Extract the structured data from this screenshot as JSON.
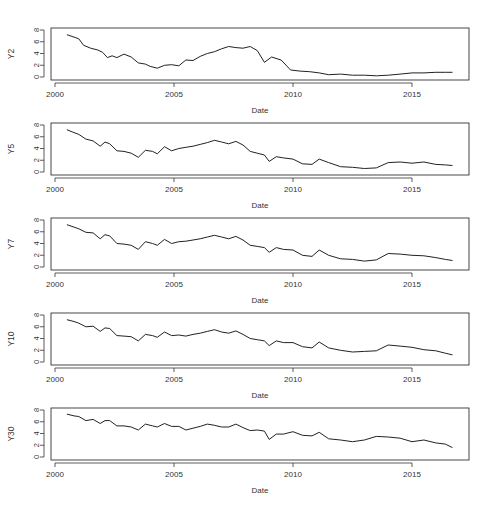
{
  "chart_data": [
    {
      "type": "line",
      "title": "",
      "xlabel": "Date",
      "ylabel": "Y2",
      "xlim": [
        2000,
        2017.3
      ],
      "ylim": [
        0,
        8
      ],
      "xticks": [
        2000,
        2005,
        2010,
        2015
      ],
      "yticks": [
        0,
        2,
        4,
        6,
        8
      ],
      "grid": false,
      "legend": null,
      "x": [
        2000.5,
        2000.8,
        2001.0,
        2001.2,
        2001.5,
        2001.8,
        2002.0,
        2002.2,
        2002.4,
        2002.6,
        2002.9,
        2003.2,
        2003.5,
        2003.8,
        2004.0,
        2004.3,
        2004.6,
        2004.9,
        2005.2,
        2005.5,
        2005.8,
        2006.1,
        2006.4,
        2006.7,
        2007.0,
        2007.3,
        2007.6,
        2007.9,
        2008.2,
        2008.5,
        2008.8,
        2009.1,
        2009.5,
        2009.9,
        2010.3,
        2010.7,
        2011.1,
        2011.5,
        2012.0,
        2012.5,
        2013.0,
        2013.5,
        2014.0,
        2014.5,
        2015.0,
        2015.5,
        2016.0,
        2016.4,
        2016.7
      ],
      "values": [
        7.2,
        6.8,
        6.5,
        5.4,
        4.9,
        4.6,
        4.2,
        3.3,
        3.6,
        3.3,
        3.9,
        3.4,
        2.4,
        2.2,
        1.8,
        1.5,
        2.0,
        2.1,
        1.9,
        2.9,
        2.8,
        3.5,
        4.0,
        4.3,
        4.8,
        5.2,
        5.0,
        4.9,
        5.2,
        4.5,
        2.5,
        3.4,
        2.9,
        1.2,
        1.0,
        0.9,
        0.7,
        0.4,
        0.5,
        0.3,
        0.3,
        0.2,
        0.3,
        0.5,
        0.7,
        0.7,
        0.8,
        0.8,
        0.8
      ]
    },
    {
      "type": "line",
      "xlabel": "Date",
      "ylabel": "Y5",
      "xlim": [
        2000,
        2017.3
      ],
      "ylim": [
        0,
        8
      ],
      "xticks": [
        2000,
        2005,
        2010,
        2015
      ],
      "yticks": [
        0,
        2,
        4,
        6,
        8
      ],
      "x": [
        2000.5,
        2000.8,
        2001.0,
        2001.3,
        2001.6,
        2001.9,
        2002.1,
        2002.3,
        2002.6,
        2002.9,
        2003.2,
        2003.5,
        2003.8,
        2004.1,
        2004.3,
        2004.6,
        2004.9,
        2005.2,
        2005.5,
        2005.8,
        2006.1,
        2006.4,
        2006.7,
        2007.0,
        2007.3,
        2007.6,
        2007.9,
        2008.2,
        2008.5,
        2008.8,
        2009.0,
        2009.3,
        2009.6,
        2010.0,
        2010.4,
        2010.8,
        2011.1,
        2011.5,
        2012.0,
        2012.5,
        2013.0,
        2013.5,
        2014.0,
        2014.5,
        2015.0,
        2015.5,
        2016.0,
        2016.4,
        2016.7
      ],
      "values": [
        7.2,
        6.7,
        6.4,
        5.6,
        5.3,
        4.4,
        5.1,
        4.8,
        3.6,
        3.5,
        3.2,
        2.5,
        3.7,
        3.5,
        3.1,
        4.3,
        3.6,
        4.0,
        4.2,
        4.4,
        4.7,
        5.0,
        5.4,
        5.1,
        4.8,
        5.2,
        4.6,
        3.5,
        3.2,
        2.9,
        1.8,
        2.6,
        2.4,
        2.2,
        1.4,
        1.3,
        2.2,
        1.6,
        0.9,
        0.8,
        0.6,
        0.7,
        1.6,
        1.7,
        1.5,
        1.7,
        1.3,
        1.2,
        1.1
      ]
    },
    {
      "type": "line",
      "xlabel": "Date",
      "ylabel": "Y7",
      "xlim": [
        2000,
        2017.3
      ],
      "ylim": [
        0,
        8
      ],
      "xticks": [
        2000,
        2005,
        2010,
        2015
      ],
      "yticks": [
        0,
        2,
        4,
        6,
        8
      ],
      "x": [
        2000.5,
        2000.8,
        2001.0,
        2001.3,
        2001.6,
        2001.9,
        2002.1,
        2002.3,
        2002.6,
        2002.9,
        2003.2,
        2003.5,
        2003.8,
        2004.1,
        2004.3,
        2004.6,
        2004.9,
        2005.2,
        2005.5,
        2005.8,
        2006.1,
        2006.4,
        2006.7,
        2007.0,
        2007.3,
        2007.6,
        2007.9,
        2008.2,
        2008.5,
        2008.8,
        2009.0,
        2009.3,
        2009.6,
        2010.0,
        2010.4,
        2010.8,
        2011.1,
        2011.5,
        2012.0,
        2012.5,
        2013.0,
        2013.5,
        2014.0,
        2014.5,
        2015.0,
        2015.5,
        2016.0,
        2016.4,
        2016.7
      ],
      "values": [
        7.2,
        6.8,
        6.5,
        5.9,
        5.8,
        4.8,
        5.5,
        5.3,
        4.0,
        3.9,
        3.7,
        3.0,
        4.3,
        4.0,
        3.7,
        4.7,
        4.0,
        4.3,
        4.4,
        4.6,
        4.8,
        5.1,
        5.4,
        5.1,
        4.8,
        5.2,
        4.6,
        3.7,
        3.5,
        3.3,
        2.5,
        3.3,
        3.0,
        2.9,
        2.0,
        1.8,
        2.9,
        2.0,
        1.4,
        1.3,
        1.0,
        1.2,
        2.3,
        2.2,
        2.0,
        1.9,
        1.6,
        1.3,
        1.1
      ]
    },
    {
      "type": "line",
      "xlabel": "Date",
      "ylabel": "Y10",
      "xlim": [
        2000,
        2017.3
      ],
      "ylim": [
        0,
        8
      ],
      "xticks": [
        2000,
        2005,
        2010,
        2015
      ],
      "yticks": [
        0,
        2,
        4,
        6,
        8
      ],
      "x": [
        2000.5,
        2000.8,
        2001.0,
        2001.3,
        2001.6,
        2001.9,
        2002.1,
        2002.3,
        2002.6,
        2002.9,
        2003.2,
        2003.5,
        2003.8,
        2004.1,
        2004.3,
        2004.6,
        2004.9,
        2005.2,
        2005.5,
        2005.8,
        2006.1,
        2006.4,
        2006.7,
        2007.0,
        2007.3,
        2007.6,
        2007.9,
        2008.2,
        2008.5,
        2008.8,
        2009.0,
        2009.3,
        2009.6,
        2010.0,
        2010.4,
        2010.8,
        2011.1,
        2011.5,
        2012.0,
        2012.5,
        2013.0,
        2013.5,
        2014.0,
        2014.5,
        2015.0,
        2015.5,
        2016.0,
        2016.4,
        2016.7
      ],
      "values": [
        7.2,
        6.9,
        6.6,
        6.0,
        6.1,
        5.2,
        5.8,
        5.7,
        4.5,
        4.4,
        4.3,
        3.6,
        4.7,
        4.5,
        4.2,
        5.1,
        4.5,
        4.6,
        4.4,
        4.7,
        4.9,
        5.2,
        5.5,
        5.1,
        4.9,
        5.3,
        4.7,
        4.0,
        3.8,
        3.6,
        2.8,
        3.6,
        3.3,
        3.3,
        2.6,
        2.4,
        3.4,
        2.4,
        2.0,
        1.7,
        1.8,
        1.9,
        2.9,
        2.7,
        2.5,
        2.1,
        1.9,
        1.5,
        1.2
      ]
    },
    {
      "type": "line",
      "xlabel": "Date",
      "ylabel": "Y30",
      "xlim": [
        2000,
        2017.3
      ],
      "ylim": [
        0,
        8
      ],
      "xticks": [
        2000,
        2005,
        2010,
        2015
      ],
      "yticks": [
        0,
        2,
        4,
        6,
        8
      ],
      "x": [
        2000.5,
        2000.8,
        2001.0,
        2001.3,
        2001.6,
        2001.9,
        2002.1,
        2002.3,
        2002.6,
        2002.9,
        2003.2,
        2003.5,
        2003.8,
        2004.1,
        2004.3,
        2004.6,
        2004.9,
        2005.2,
        2005.5,
        2005.8,
        2006.1,
        2006.4,
        2006.7,
        2007.0,
        2007.3,
        2007.6,
        2007.9,
        2008.2,
        2008.5,
        2008.8,
        2009.0,
        2009.3,
        2009.6,
        2010.0,
        2010.4,
        2010.8,
        2011.1,
        2011.5,
        2012.0,
        2012.5,
        2013.0,
        2013.5,
        2014.0,
        2014.5,
        2015.0,
        2015.5,
        2016.0,
        2016.4,
        2016.7
      ],
      "values": [
        7.3,
        7.0,
        6.9,
        6.2,
        6.4,
        5.7,
        6.2,
        6.2,
        5.3,
        5.3,
        5.1,
        4.6,
        5.6,
        5.3,
        5.1,
        5.7,
        5.2,
        5.2,
        4.6,
        4.9,
        5.2,
        5.6,
        5.4,
        5.1,
        5.1,
        5.6,
        5.0,
        4.5,
        4.6,
        4.4,
        3.0,
        3.9,
        3.9,
        4.3,
        3.7,
        3.6,
        4.2,
        3.1,
        2.9,
        2.6,
        2.9,
        3.5,
        3.4,
        3.2,
        2.6,
        2.9,
        2.4,
        2.2,
        1.6
      ]
    }
  ]
}
